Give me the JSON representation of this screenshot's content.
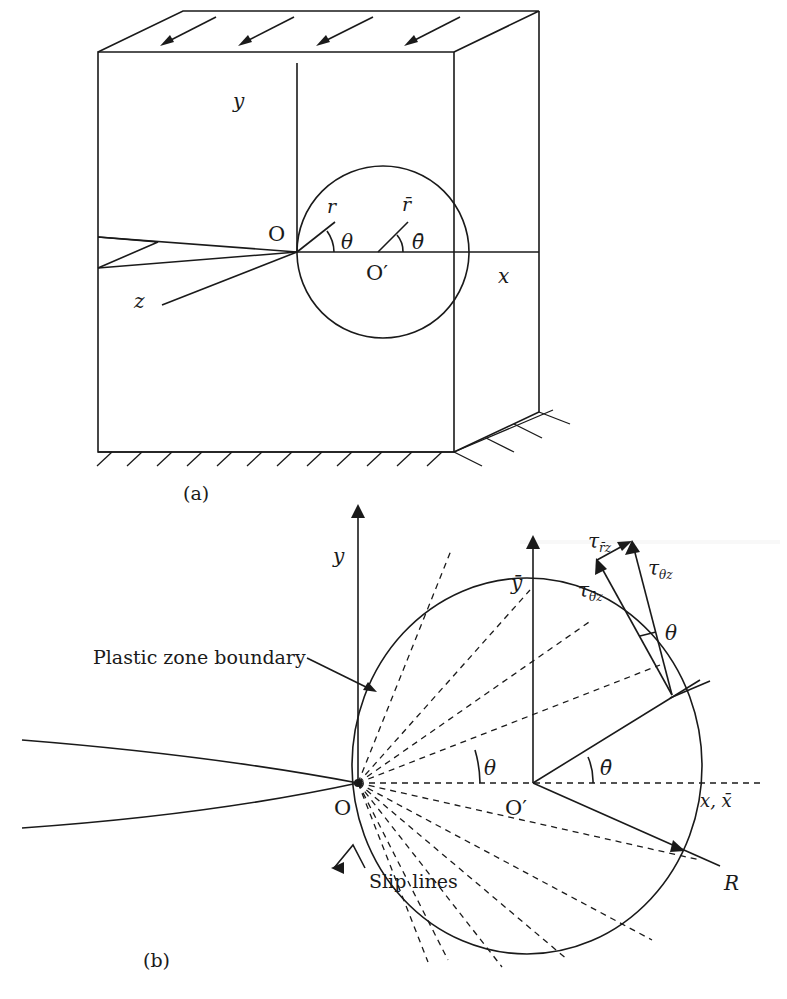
{
  "figure": {
    "panel_a": {
      "caption": "(a)",
      "labels": {
        "y_axis": "y",
        "x_axis": "x",
        "z_axis": "z",
        "origin": "O",
        "origin_prime": "O′",
        "r": "r",
        "r_bar": "r̄",
        "theta": "θ",
        "theta_bar": "θ̄"
      },
      "load_arrows_count": 4
    },
    "panel_b": {
      "caption": "(b)",
      "labels": {
        "y_axis": "y",
        "y_bar_axis": "ȳ",
        "x_axis": "x, x̄",
        "origin": "O",
        "origin_prime": "O′",
        "theta": "θ",
        "theta_bar": "θ̄",
        "theta_stress": "θ",
        "R": "R",
        "tau_rbar_z": "τ",
        "tau_rbar_z_sub": "r̄z",
        "tau_theta_z": "τ",
        "tau_theta_z_sub": "θz",
        "tau_thetabar_z": "τ",
        "tau_thetabar_z_sub": "θ̄z",
        "plastic_zone": "Plastic zone boundary",
        "slip_lines": "Slip lines"
      }
    }
  }
}
